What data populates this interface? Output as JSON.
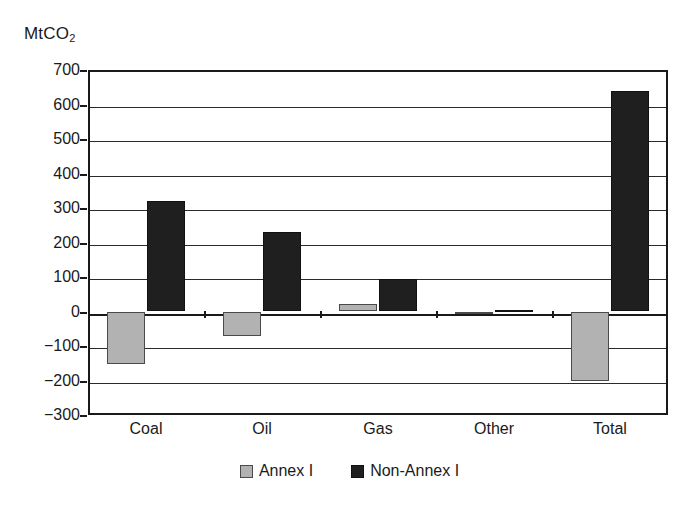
{
  "unit_label": {
    "base": "MtCO",
    "subscript": "2"
  },
  "legend": {
    "items": [
      {
        "label": "Annex I",
        "color": "#b2b2b2",
        "swatch": "annex"
      },
      {
        "label": "Non-Annex I",
        "color": "#1f1f1f",
        "swatch": "nonannex"
      }
    ]
  },
  "chart_data": {
    "type": "bar",
    "title": "",
    "subtitle": "",
    "xlabel": "",
    "ylabel": "MtCO2",
    "categories": [
      "Coal",
      "Oil",
      "Gas",
      "Other",
      "Total"
    ],
    "series": [
      {
        "name": "Annex I",
        "color": "#b2b2b2",
        "values": [
          -152,
          -72,
          22,
          0,
          -200
        ]
      },
      {
        "name": "Non-Annex I",
        "color": "#1f1f1f",
        "values": [
          320,
          230,
          93,
          5,
          638
        ]
      }
    ],
    "ylim": [
      -300,
      700
    ],
    "ytick_labels": [
      "700",
      "600",
      "500",
      "400",
      "300",
      "200",
      "100",
      "0",
      "−100",
      "−200",
      "−300"
    ],
    "ytick_values": [
      700,
      600,
      500,
      400,
      300,
      200,
      100,
      0,
      -100,
      -200,
      -300
    ],
    "grid": true,
    "grid_axis": "y",
    "legend_position": "bottom-center",
    "annotations": []
  }
}
